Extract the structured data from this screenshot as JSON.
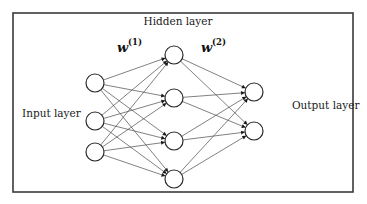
{
  "diagram": {
    "labels": {
      "hidden_layer": "Hidden layer",
      "input_layer": "Input layer",
      "output_layer": "Output layer",
      "w1_base": "w",
      "w1_sup": "(1)",
      "w2_base": "w",
      "w2_sup": "(2)"
    },
    "layers": {
      "input": {
        "count": 3,
        "nodes": [
          [
            95,
            83
          ],
          [
            95,
            121
          ],
          [
            95,
            152
          ]
        ]
      },
      "hidden": {
        "count": 4,
        "nodes": [
          [
            174,
            55
          ],
          [
            174,
            98
          ],
          [
            174,
            141
          ],
          [
            174,
            179
          ]
        ]
      },
      "output": {
        "count": 2,
        "nodes": [
          [
            254,
            92
          ],
          [
            254,
            131
          ]
        ]
      }
    },
    "node_radius": 9,
    "connections": "fully-connected",
    "colors": {
      "stroke": "#2a2a2a",
      "background": "#ffffff"
    }
  }
}
